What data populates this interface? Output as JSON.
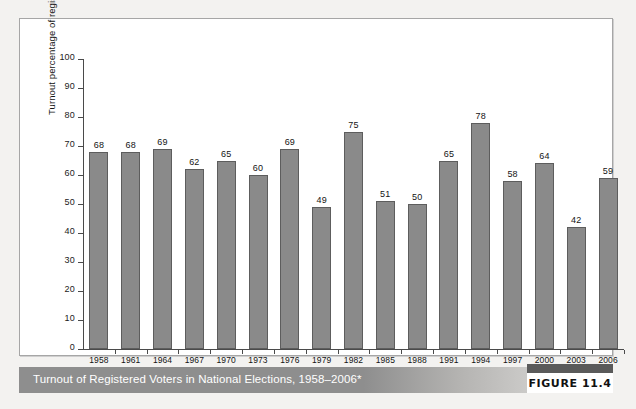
{
  "figure": {
    "caption": "Turnout of Registered Voters in National Elections, 1958–2006*",
    "number_label": "FIGURE 11.4"
  },
  "chart_data": {
    "type": "bar",
    "title": "Turnout of Registered Voters in National Elections, 1958–2006*",
    "xlabel": "Year",
    "ylabel": "Turnout percentage of registered voters",
    "ylim": [
      0,
      100
    ],
    "yticks": [
      0,
      10,
      20,
      30,
      40,
      50,
      60,
      70,
      80,
      90,
      100
    ],
    "grid": false,
    "legend": null,
    "categories": [
      "1958",
      "1961",
      "1964",
      "1967",
      "1970",
      "1973",
      "1976",
      "1979",
      "1982",
      "1985",
      "1988",
      "1991",
      "1994",
      "1997",
      "2000",
      "2003",
      "2006"
    ],
    "values": [
      68,
      68,
      69,
      62,
      65,
      60,
      69,
      49,
      75,
      51,
      50,
      65,
      78,
      58,
      64,
      42,
      59
    ],
    "bar_color": "#8a8a8a",
    "bar_edge_color": "#5d5d5d"
  }
}
